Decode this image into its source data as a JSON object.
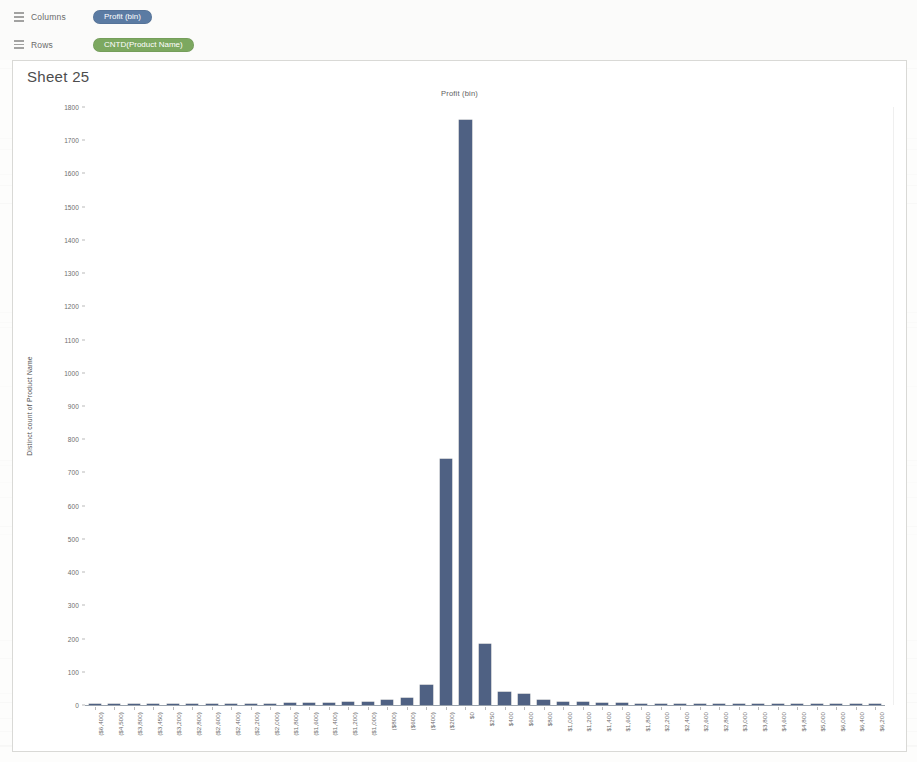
{
  "shelves": {
    "columns": {
      "label": "Columns",
      "icon": "columns-icon",
      "pill": "Profit (bin)",
      "pill_color": "#5b7ba3"
    },
    "rows": {
      "label": "Rows",
      "icon": "rows-icon",
      "pill": "CNTD(Product Name)",
      "pill_color": "#7ca860"
    }
  },
  "worksheet": {
    "sheet_title": "Sheet 25",
    "chart_title": "Profit (bin)"
  },
  "chart_data": {
    "type": "bar",
    "title": "Profit (bin)",
    "xlabel": "Profit (bin)",
    "ylabel": "Distinct count of Product Name",
    "ylim": [
      0,
      1800
    ],
    "ytick_step": 100,
    "grid": false,
    "legend": "none",
    "bar_color": "#4f6183",
    "yticks": [
      0,
      100,
      200,
      300,
      400,
      500,
      600,
      700,
      800,
      900,
      1000,
      1100,
      1200,
      1300,
      1400,
      1500,
      1600,
      1700,
      1800
    ],
    "categories": [
      "($6,400)",
      "($4,500)",
      "($3,800)",
      "($3,450)",
      "($3,200)",
      "($2,800)",
      "($2,600)",
      "($2,400)",
      "($2,200)",
      "($2,000)",
      "($1,800)",
      "($1,600)",
      "($1,400)",
      "($1,200)",
      "($1,000)",
      "($800)",
      "($600)",
      "($400)",
      "($200)",
      "$0",
      "$250",
      "$400",
      "$600",
      "$800",
      "$1,000",
      "$1,200",
      "$1,400",
      "$1,600",
      "$1,800",
      "$2,200",
      "$2,400",
      "$2,600",
      "$2,800",
      "$3,000",
      "$3,800",
      "$4,600",
      "$4,800",
      "$5,000",
      "$6,000",
      "$6,400",
      "$6,200"
    ],
    "values": [
      2,
      2,
      2,
      2,
      2,
      3,
      3,
      3,
      3,
      4,
      5,
      5,
      6,
      8,
      10,
      14,
      22,
      60,
      740,
      1760,
      185,
      40,
      32,
      14,
      9,
      9,
      7,
      5,
      4,
      4,
      4,
      3,
      3,
      3,
      2,
      2,
      2,
      2,
      2,
      2,
      2
    ]
  }
}
